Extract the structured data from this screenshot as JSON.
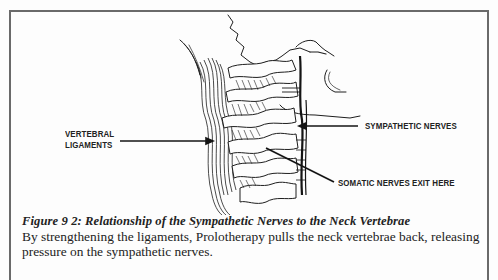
{
  "figure": {
    "labels": {
      "vertebral_ligaments_line1": "Vertebral",
      "vertebral_ligaments_line2": "Ligaments",
      "sympathetic_nerves": "Sympathetic Nerves",
      "somatic_nerves": "Somatic Nerves Exit Here"
    },
    "caption_title": "Figure 9 2: Relationship of the Sympathetic Nerves to the Neck Vertebrae",
    "caption_body": "By strengthening the ligaments, Prolotherapy pulls the neck vertebrae back, releasing pressure on the sympathetic nerves.",
    "colors": {
      "ink": "#1a1a1a",
      "frame": "#6a6a6a",
      "paper": "#fdfdfd"
    }
  }
}
